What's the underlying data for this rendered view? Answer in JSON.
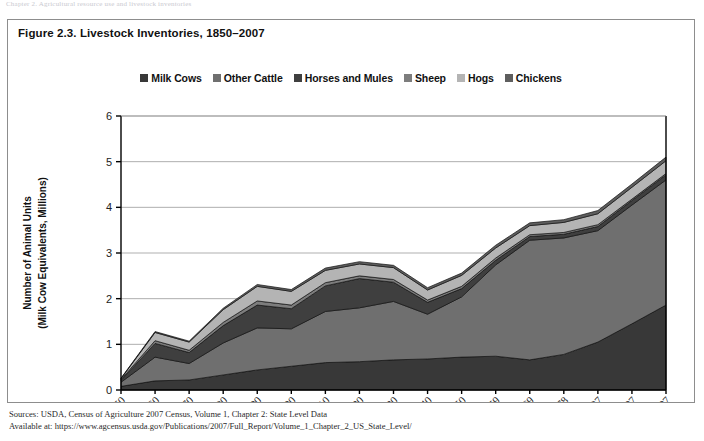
{
  "top_strip_text": "Chapter 2. Agricultural resource use and livestock inventories",
  "figure": {
    "title": "Figure 2.3. Livestock Inventories, 1850–2007"
  },
  "footer": {
    "line1": "Sources: USDA, Census of Agriculture 2007 Census, Volume 1, Chapter 2: State Level Data",
    "line2": "Available at: https://www.agcensus.usda.gov/Publications/2007/Full_Report/Volume_1_Chapter_2_US_State_Level/"
  },
  "chart_data": {
    "type": "area",
    "stacked": true,
    "title": "Figure 2.3. Livestock Inventories, 1850–2007",
    "xlabel": "",
    "ylabel": "Number of Animal Units\n(Milk Cow Equivalents, Millions)",
    "ylabel_line1": "Number of Animal Units",
    "ylabel_line2": "(Milk Cow Equivalents, Millions)",
    "ylim": [
      0,
      6
    ],
    "yticks": [
      0,
      1,
      2,
      3,
      4,
      5,
      6
    ],
    "grid": true,
    "legend_position": "top",
    "categories": [
      "1850",
      "1860",
      "1870",
      "1880",
      "1890",
      "1900",
      "1910",
      "1920",
      "1930",
      "1940",
      "1950",
      "1959",
      "1969",
      "1978",
      "1987",
      "1997",
      "2007"
    ],
    "series": [
      {
        "name": "Milk Cows",
        "color": "#383838",
        "values": [
          0.08,
          0.2,
          0.22,
          0.33,
          0.44,
          0.52,
          0.6,
          0.62,
          0.66,
          0.68,
          0.72,
          0.74,
          0.66,
          0.78,
          1.05,
          1.45,
          1.86
        ]
      },
      {
        "name": "Other Cattle",
        "color": "#6f6f6f",
        "values": [
          0.09,
          0.52,
          0.36,
          0.7,
          0.92,
          0.82,
          1.12,
          1.18,
          1.28,
          0.98,
          1.32,
          2.0,
          2.62,
          2.55,
          2.44,
          2.6,
          2.74
        ]
      },
      {
        "name": "Horses and Mules",
        "color": "#3f3f3f",
        "values": [
          0.04,
          0.3,
          0.24,
          0.38,
          0.5,
          0.44,
          0.56,
          0.64,
          0.42,
          0.26,
          0.18,
          0.1,
          0.08,
          0.08,
          0.09,
          0.1,
          0.11
        ]
      },
      {
        "name": "Sheep",
        "color": "#7d7d7d",
        "values": [
          0.02,
          0.06,
          0.05,
          0.07,
          0.09,
          0.08,
          0.07,
          0.06,
          0.06,
          0.05,
          0.05,
          0.05,
          0.04,
          0.04,
          0.04,
          0.03,
          0.03
        ]
      },
      {
        "name": "Hogs",
        "color": "#b4b4b4",
        "values": [
          0.02,
          0.18,
          0.18,
          0.28,
          0.32,
          0.3,
          0.27,
          0.26,
          0.26,
          0.22,
          0.24,
          0.22,
          0.2,
          0.22,
          0.24,
          0.26,
          0.28
        ]
      },
      {
        "name": "Chickens",
        "color": "#5e5e5e",
        "values": [
          0.01,
          0.02,
          0.02,
          0.03,
          0.04,
          0.04,
          0.05,
          0.05,
          0.05,
          0.05,
          0.05,
          0.06,
          0.06,
          0.06,
          0.07,
          0.07,
          0.08
        ]
      }
    ]
  }
}
